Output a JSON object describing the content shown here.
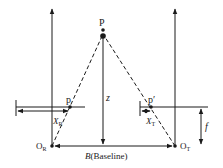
{
  "diagram": {
    "colors": {
      "stroke": "#1a1a1a",
      "background": "#ffffff"
    },
    "labels": {
      "object_point": "P",
      "left_image_point": "p",
      "right_image_point": "p′",
      "depth": "z",
      "left_offset": "X",
      "left_offset_sub": "R",
      "right_offset": "X",
      "right_offset_sub": "T",
      "left_center": "O",
      "left_center_sub": "R",
      "right_center": "O",
      "right_center_sub": "T",
      "focal_length": "f",
      "baseline": "B(Baseline)",
      "baseline_symbol": "B",
      "baseline_text": "(Baseline)"
    }
  }
}
